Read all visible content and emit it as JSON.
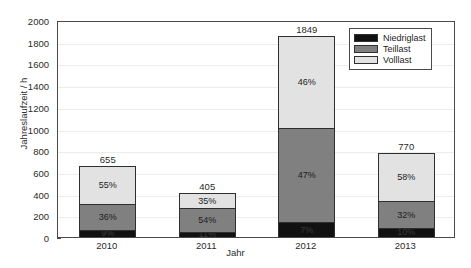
{
  "chart_data": {
    "type": "bar",
    "stacked": true,
    "title": "",
    "xlabel": "Jahr",
    "ylabel": "Jahreslaufzeit / h",
    "categories": [
      "2010",
      "2011",
      "2012",
      "2013"
    ],
    "ylim": [
      0,
      2000
    ],
    "yticks": [
      0,
      200,
      400,
      600,
      800,
      1000,
      1200,
      1400,
      1600,
      1800,
      2000
    ],
    "ytick_labels": [
      "0",
      "200",
      "400",
      "600",
      "800",
      "1000",
      "1200",
      "1400",
      "1600",
      "1800",
      "2000"
    ],
    "grid": true,
    "legend_position": "top-right",
    "totals": [
      655,
      405,
      1849,
      770
    ],
    "total_labels": [
      "655",
      "405",
      "1849",
      "770"
    ],
    "series": [
      {
        "name": "Niedriglast",
        "color": "#111111",
        "percent": [
          9,
          11,
          7,
          10
        ],
        "percent_labels": [
          "9%",
          "11%",
          "7%",
          "10%"
        ],
        "values": [
          59,
          45,
          129,
          77
        ]
      },
      {
        "name": "Teillast",
        "color": "#808080",
        "percent": [
          36,
          54,
          47,
          32
        ],
        "percent_labels": [
          "36%",
          "54%",
          "47%",
          "32%"
        ],
        "values": [
          236,
          219,
          869,
          246
        ]
      },
      {
        "name": "Volllast",
        "color": "#e2e2e2",
        "percent": [
          55,
          35,
          46,
          58
        ],
        "percent_labels": [
          "55%",
          "35%",
          "46%",
          "58%"
        ],
        "values": [
          360,
          142,
          851,
          447
        ]
      }
    ]
  },
  "legend": {
    "items": [
      {
        "label": "Niedriglast",
        "color": "#111111"
      },
      {
        "label": "Teillast",
        "color": "#808080"
      },
      {
        "label": "Volllast",
        "color": "#e2e2e2"
      }
    ]
  }
}
